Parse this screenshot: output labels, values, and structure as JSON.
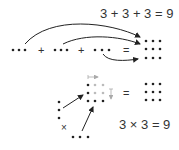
{
  "top": {
    "equation": "3 + 3 + 3 = 9",
    "groups": 3,
    "per_group": 3,
    "plus": "+",
    "equals": "=",
    "result_grid": "3x3"
  },
  "bottom": {
    "equation": "3 × 3 = 9",
    "times": "×",
    "equals": "=",
    "result_grid": "3x3"
  },
  "colors": {
    "dot": "#222222",
    "ghost_dot": "#bbbbbb",
    "ghost_arrow": "#aaaaaa"
  }
}
